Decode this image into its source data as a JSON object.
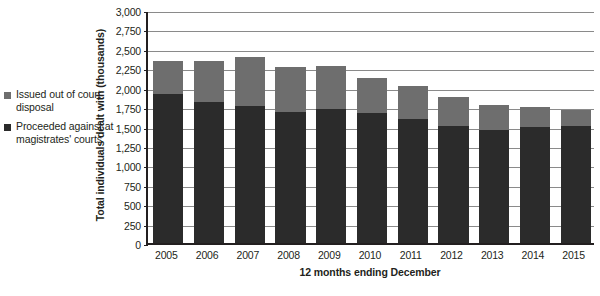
{
  "chart_data": {
    "type": "bar",
    "subtype": "stacked-vertical",
    "title": "",
    "xlabel": "12 months ending December",
    "ylabel": "Total individuals dealt with (thousands)",
    "categories": [
      "2005",
      "2006",
      "2007",
      "2008",
      "2009",
      "2010",
      "2011",
      "2012",
      "2013",
      "2014",
      "2015"
    ],
    "series": [
      {
        "name": "Proceeded against at magistrates' courts",
        "color": "#2b2b2b",
        "values": [
          1920,
          1810,
          1760,
          1690,
          1720,
          1680,
          1600,
          1510,
          1450,
          1500,
          1510
        ]
      },
      {
        "name": "Issued out of court disposal",
        "color": "#6e6e6e",
        "values": [
          430,
          540,
          640,
          570,
          560,
          440,
          420,
          370,
          330,
          250,
          200
        ]
      }
    ],
    "totals": [
      2350,
      2350,
      2400,
      2260,
      2280,
      2120,
      2020,
      1880,
      1780,
      1750,
      1710
    ],
    "ylim": [
      0,
      3000
    ],
    "ytick_step": 250,
    "yticks": [
      "0",
      "250",
      "500",
      "750",
      "1,000",
      "1,250",
      "1,500",
      "1,750",
      "2,000",
      "2,250",
      "2,500",
      "2,750",
      "3,000"
    ],
    "grid": true,
    "legend_position": "left"
  },
  "legend": {
    "items": [
      {
        "label": "Issued out of court disposal",
        "color": "#6e6e6e"
      },
      {
        "label": "Proceeded against at magistrates' courts",
        "color": "#2b2b2b"
      }
    ]
  }
}
